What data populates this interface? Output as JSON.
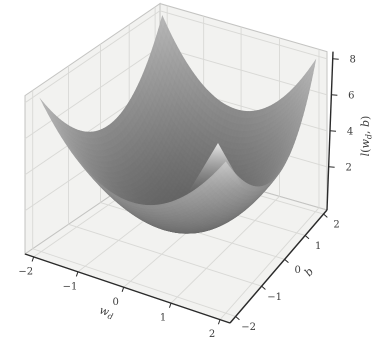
{
  "figure": {
    "width": 388,
    "height": 344,
    "background": "#ffffff"
  },
  "chart_data": {
    "type": "surface",
    "title": "",
    "z_function": "l(w_d, b) = w_d^2 + b^2",
    "x_axis": {
      "label": "w_d",
      "ticks": [
        -2,
        -1,
        0,
        1,
        2
      ],
      "data_range": [
        -2,
        2
      ],
      "axis_range": [
        -2.2,
        2.2
      ]
    },
    "y_axis": {
      "label": "b",
      "ticks": [
        -2,
        -1,
        0,
        1,
        2
      ],
      "data_range": [
        -2,
        2
      ],
      "axis_range": [
        -2.2,
        2.2
      ]
    },
    "z_axis": {
      "label": "l(w_d, b)",
      "ticks": [
        2,
        4,
        6,
        8
      ],
      "data_range": [
        0,
        8
      ],
      "axis_range": [
        -0.4,
        8.4
      ]
    },
    "grid": true,
    "legend": false,
    "colors": {
      "surface_low": "#606060",
      "surface_high": "#b8b8b8",
      "pane": "#f2f2f0",
      "grid_line": "#d9d9d6",
      "pane_edge": "#c4c4c2",
      "axis_line": "#2a2a2a",
      "tick_label": "#3d3d3d",
      "highlight": "#ececec"
    }
  }
}
